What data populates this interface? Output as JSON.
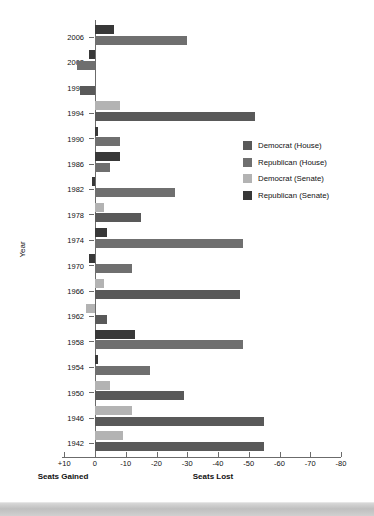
{
  "chart_data": {
    "type": "bar",
    "title": "",
    "orientation": "horizontal",
    "xlabel": "",
    "ylabel": "Year",
    "xlim": [
      10,
      -80
    ],
    "x_ticks": [
      10,
      0,
      -10,
      -20,
      -30,
      -40,
      -50,
      -60,
      -70,
      -80
    ],
    "x_tick_labels": [
      "+10",
      "0",
      "-10",
      "-20",
      "-30",
      "-40",
      "-50",
      "-60",
      "-70",
      "-80"
    ],
    "axis_notes": {
      "left": "Seats Gained",
      "right": "Seats Lost"
    },
    "grid": false,
    "legend_position": "right",
    "series": [
      {
        "name": "Democrat (House)",
        "color": "#595959",
        "key": "dem_house"
      },
      {
        "name": "Republican (House)",
        "color": "#6f6f6f",
        "key": "rep_house"
      },
      {
        "name": "Democrat (Senate)",
        "color": "#b3b3b3",
        "key": "dem_senate"
      },
      {
        "name": "Republican (Senate)",
        "color": "#383838",
        "key": "rep_senate"
      }
    ],
    "categories": [
      2006,
      2002,
      1998,
      1994,
      1990,
      1986,
      1982,
      1978,
      1974,
      1970,
      1966,
      1962,
      1958,
      1954,
      1950,
      1946,
      1942
    ],
    "rows": [
      {
        "year": "2006",
        "senate": {
          "series": "rep_senate",
          "value": -6
        },
        "house": {
          "series": "rep_house",
          "value": -30
        }
      },
      {
        "year": "2002",
        "senate": {
          "series": "rep_senate",
          "value": 2
        },
        "house": {
          "series": "rep_house",
          "value": 6
        }
      },
      {
        "year": "1998",
        "senate": {
          "series": "dem_senate",
          "value": 0
        },
        "house": {
          "series": "dem_house",
          "value": 5
        }
      },
      {
        "year": "1994",
        "senate": {
          "series": "dem_senate",
          "value": -8
        },
        "house": {
          "series": "dem_house",
          "value": -52
        }
      },
      {
        "year": "1990",
        "senate": {
          "series": "rep_senate",
          "value": -1
        },
        "house": {
          "series": "rep_house",
          "value": -8
        }
      },
      {
        "year": "1986",
        "senate": {
          "series": "rep_senate",
          "value": -8
        },
        "house": {
          "series": "rep_house",
          "value": -5
        }
      },
      {
        "year": "1982",
        "senate": {
          "series": "rep_senate",
          "value": 1
        },
        "house": {
          "series": "rep_house",
          "value": -26
        }
      },
      {
        "year": "1978",
        "senate": {
          "series": "dem_senate",
          "value": -3
        },
        "house": {
          "series": "dem_house",
          "value": -15
        }
      },
      {
        "year": "1974",
        "senate": {
          "series": "rep_senate",
          "value": -4
        },
        "house": {
          "series": "rep_house",
          "value": -48
        }
      },
      {
        "year": "1970",
        "senate": {
          "series": "rep_senate",
          "value": 2
        },
        "house": {
          "series": "rep_house",
          "value": -12
        }
      },
      {
        "year": "1966",
        "senate": {
          "series": "dem_senate",
          "value": -3
        },
        "house": {
          "series": "dem_house",
          "value": -47
        }
      },
      {
        "year": "1962",
        "senate": {
          "series": "dem_senate",
          "value": 3
        },
        "house": {
          "series": "dem_house",
          "value": -4
        }
      },
      {
        "year": "1958",
        "senate": {
          "series": "rep_senate",
          "value": -13
        },
        "house": {
          "series": "rep_house",
          "value": -48
        }
      },
      {
        "year": "1954",
        "senate": {
          "series": "rep_senate",
          "value": -1
        },
        "house": {
          "series": "rep_house",
          "value": -18
        }
      },
      {
        "year": "1950",
        "senate": {
          "series": "dem_senate",
          "value": -5
        },
        "house": {
          "series": "dem_house",
          "value": -29
        }
      },
      {
        "year": "1946",
        "senate": {
          "series": "dem_senate",
          "value": -12
        },
        "house": {
          "series": "dem_house",
          "value": -55
        }
      },
      {
        "year": "1942",
        "senate": {
          "series": "dem_senate",
          "value": -9
        },
        "house": {
          "series": "dem_house",
          "value": -55
        }
      }
    ]
  }
}
